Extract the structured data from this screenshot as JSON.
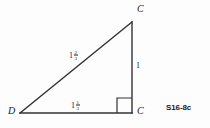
{
  "figure": {
    "type": "right-triangle-diagram",
    "caption": "S16-8c",
    "stroke_color": "#333333",
    "text_color": "#1a1a1a",
    "background_color": "#fdfdfd",
    "vertices": {
      "top": {
        "label": "C",
        "x": 132,
        "y": 22
      },
      "bottom_right": {
        "label": "C",
        "x": 132,
        "y": 113
      },
      "bottom_left": {
        "label": "D",
        "x": 20,
        "y": 113
      }
    },
    "right_angle_marker": {
      "name": "right-angle-square",
      "x": 117,
      "y": 98,
      "size": 15
    },
    "sides": {
      "hypotenuse": {
        "whole": "1",
        "numerator": "2",
        "denominator": "3"
      },
      "base": {
        "whole": "1",
        "numerator": "1",
        "denominator": "3"
      },
      "vertical": {
        "value": "1"
      }
    }
  }
}
